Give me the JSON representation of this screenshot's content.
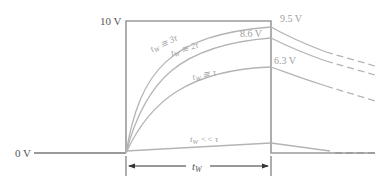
{
  "figure": {
    "axis_labels": {
      "top_level": "10 V",
      "baseline": "0 V"
    },
    "pulse_width_label": "t",
    "pulse_width_subscript": "W",
    "curves": [
      {
        "id": "3tau",
        "label_main": "t",
        "label_sub": "W",
        "label_rel": " ≅ 3τ",
        "end_value": "9.5 V",
        "fraction": 0.95
      },
      {
        "id": "2tau",
        "label_main": "t",
        "label_sub": "W",
        "label_rel": " ≅ 2τ",
        "end_value": "8.6 V",
        "fraction": 0.865
      },
      {
        "id": "1tau",
        "label_main": "t",
        "label_sub": "W",
        "label_rel": " ≅ τ",
        "end_value": "6.3 V",
        "fraction": 0.632
      },
      {
        "id": "small",
        "label_main": "t",
        "label_sub": "W",
        "label_rel": " << τ",
        "end_value": "",
        "fraction": 0.05
      }
    ],
    "colors": {
      "pulse": "#9a9a9a",
      "curves": "#b4b4b4",
      "text_dark": "#555555",
      "text_light": "#a0a0a0",
      "arrow": "#333333"
    }
  }
}
